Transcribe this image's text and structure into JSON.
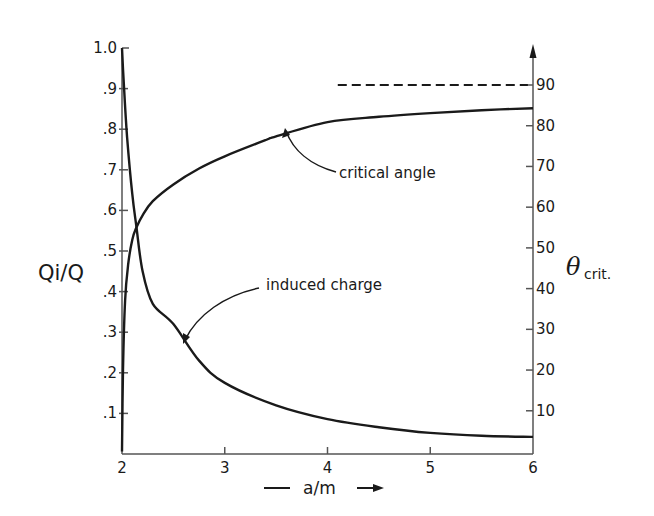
{
  "chart_data": {
    "type": "line",
    "title": "",
    "xlabel": "a/m",
    "ylabel": "Qi/Q",
    "ylabel_right": "θcrit.",
    "ylabel_right_main": "θ",
    "ylabel_right_sub": "crit.",
    "xlim": [
      2,
      6
    ],
    "ylim": [
      0,
      1.0
    ],
    "ylim_right": [
      0,
      90
    ],
    "grid": false,
    "legend": "none (curves labeled by annotations)",
    "x_ticks": [
      2,
      3,
      4,
      5,
      6
    ],
    "x_tick_labels": [
      "2",
      "3",
      "4",
      "5",
      "6"
    ],
    "y_ticks": [
      0.1,
      0.2,
      0.3,
      0.4,
      0.5,
      0.6,
      0.7,
      0.8,
      0.9,
      1.0
    ],
    "y_tick_labels": [
      ".1",
      ".2",
      ".3",
      ".4",
      ".5",
      ".6",
      ".7",
      ".8",
      ".9",
      "1.0"
    ],
    "y_right_ticks": [
      10,
      20,
      30,
      40,
      50,
      60,
      70,
      80,
      90
    ],
    "y_right_tick_labels": [
      "10",
      "20",
      "30",
      "40",
      "50",
      "60",
      "70",
      "80",
      "90"
    ],
    "series": [
      {
        "name": "induced charge",
        "axis": "left",
        "x": [
          2.0,
          2.02,
          2.05,
          2.1,
          2.14,
          2.2,
          2.3,
          2.5,
          2.75,
          3.0,
          3.5,
          4.0,
          4.5,
          5.0,
          5.5,
          6.0
        ],
        "values": [
          1.0,
          0.9,
          0.78,
          0.64,
          0.56,
          0.45,
          0.37,
          0.32,
          0.23,
          0.175,
          0.12,
          0.086,
          0.066,
          0.052,
          0.045,
          0.042
        ]
      },
      {
        "name": "critical angle",
        "axis": "right",
        "x": [
          2.0,
          2.01,
          2.03,
          2.06,
          2.1,
          2.14,
          2.2,
          2.3,
          2.5,
          2.75,
          3.0,
          3.4,
          3.5,
          4.0,
          4.5,
          5.0,
          5.5,
          6.0
        ],
        "values": [
          0,
          20,
          37,
          46,
          52,
          55,
          58,
          61.5,
          65.6,
          69.5,
          72.5,
          76.5,
          77.4,
          80.9,
          82.2,
          83.1,
          83.8,
          84.3
        ]
      },
      {
        "name": "asymptote (90°)",
        "axis": "right",
        "style": "dashed",
        "x": [
          4.1,
          5.95
        ],
        "values": [
          90,
          90
        ]
      }
    ],
    "annotations": [
      {
        "text": "critical angle",
        "points_to_x": 3.6,
        "points_to_series": "critical angle"
      },
      {
        "text": "induced charge",
        "points_to_x": 2.6,
        "points_to_series": "induced charge"
      }
    ]
  },
  "labels": {
    "y_left_title": "Qi/Q",
    "y_right_theta": "θ",
    "y_right_sub": "crit.",
    "x_title": "a/m",
    "annot_critical": "critical angle",
    "annot_induced": "induced charge"
  },
  "colors": {
    "ink": "#1a1a1a",
    "axis": "#555555",
    "background": "#ffffff"
  }
}
